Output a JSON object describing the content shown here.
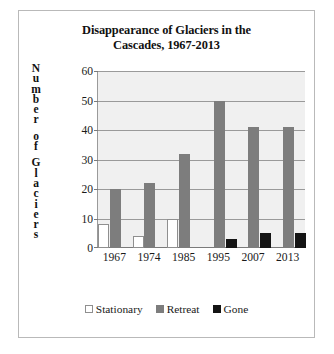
{
  "chart_data": {
    "type": "bar",
    "title": "Disappearance of Glaciers in the Cascades, 1967-2013",
    "title_lines": [
      "Disappearance of Glaciers in the",
      "Cascades, 1967-2013"
    ],
    "xlabel": "",
    "ylabel": "Number of Glaciers",
    "ylabel_letters": [
      "N",
      "u",
      "m",
      "b",
      "e",
      "r",
      " ",
      "o",
      "f",
      " ",
      "G",
      "l",
      "a",
      "c",
      "i",
      "e",
      "r",
      "s"
    ],
    "categories": [
      "1967",
      "1974",
      "1985",
      "1995",
      "2007",
      "2013"
    ],
    "ylim": [
      0,
      60
    ],
    "yticks": [
      0,
      10,
      20,
      30,
      40,
      50,
      60
    ],
    "ytick_labels": [
      "0",
      "10",
      "20",
      "30",
      "40",
      "50",
      "60"
    ],
    "grid": true,
    "grid_axis": "y",
    "legend_position": "bottom",
    "series": [
      {
        "name": "Stationary",
        "color": "#ffffff",
        "border_color": "#8f8f8f",
        "values": [
          8,
          4,
          10,
          0,
          0,
          0
        ]
      },
      {
        "name": "Retreat",
        "color": "#7d7d7d",
        "border_color": "#7d7d7d",
        "values": [
          20,
          22,
          32,
          50,
          41,
          41
        ]
      },
      {
        "name": "Gone",
        "color": "#141414",
        "border_color": "#141414",
        "values": [
          0,
          0,
          0,
          3,
          5,
          5
        ]
      }
    ],
    "plot_background": "#f0f0f0",
    "frame_border_color": "#b9b9b9",
    "gridline_color": "#9a9a9a"
  }
}
